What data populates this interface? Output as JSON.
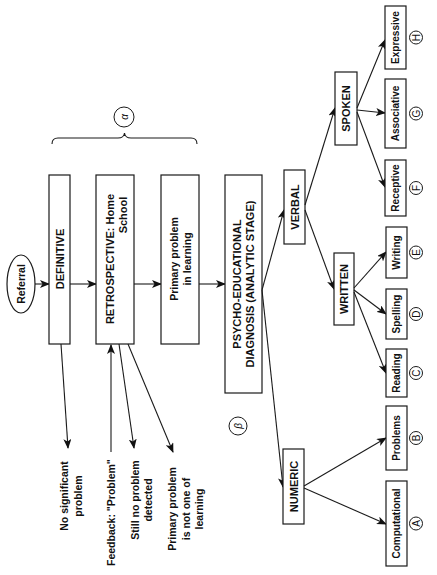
{
  "diagram": {
    "orientation": "rotated-90-ccw",
    "start": {
      "label": "Referral"
    },
    "stage_group_symbol": "α",
    "analytic_symbol": "β",
    "stages": [
      {
        "id": "definitive",
        "label": "DEFINITIVE"
      },
      {
        "id": "retrospective",
        "label_line1": "RETROSPECTIVE: Home",
        "label_line2": "School"
      },
      {
        "id": "primary",
        "label_line1": "Primary problem",
        "label_line2": "in learning"
      },
      {
        "id": "psycho",
        "label_line1": "PSYCHO-EDUCATIONAL",
        "label_line2": "DIAGNOSIS (ANALYTIC STAGE)"
      }
    ],
    "outcomes": {
      "no_significant": {
        "line1": "No significant",
        "line2": "problem"
      },
      "feedback": {
        "line1": "Feedback: \"Problem\""
      },
      "still_no": {
        "line1": "Still no problem",
        "line2": "detected"
      },
      "not_learning": {
        "line1": "Primary problem",
        "line2": "is not one of",
        "line3": "learning"
      }
    },
    "branches": {
      "verbal": "VERBAL",
      "numeric": "NUMERIC",
      "written": "WRITTEN",
      "spoken": "SPOKEN"
    },
    "leaves": [
      {
        "label": "Computational",
        "letter": "A"
      },
      {
        "label": "Problems",
        "letter": "B"
      },
      {
        "label": "Reading",
        "letter": "C"
      },
      {
        "label": "Spelling",
        "letter": "D"
      },
      {
        "label": "Writing",
        "letter": "E"
      },
      {
        "label": "Receptive",
        "letter": "F"
      },
      {
        "label": "Associative",
        "letter": "G"
      },
      {
        "label": "Expressive",
        "letter": "H"
      }
    ]
  }
}
